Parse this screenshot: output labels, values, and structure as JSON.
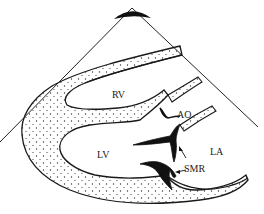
{
  "diagram": {
    "labels": {
      "rv": "RV",
      "lv": "LV",
      "ao": "AO",
      "la": "LA",
      "smr": "SMR"
    },
    "colors": {
      "stroke": "#1a1a1a",
      "background": "#ffffff"
    }
  }
}
